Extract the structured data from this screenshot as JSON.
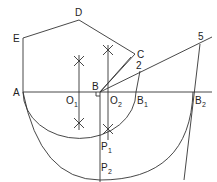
{
  "diagram": {
    "type": "geometric-construction",
    "labels": {
      "A": "A",
      "B": "B",
      "C": "C",
      "D": "D",
      "E": "E",
      "O1_main": "O",
      "O1_sub": "1",
      "O2_main": "O",
      "O2_sub": "2",
      "B1_main": "B",
      "B1_sub": "1",
      "B2_main": "B",
      "B2_sub": "2",
      "P1_main": "P",
      "P1_sub": "1",
      "P2_main": "P",
      "P2_sub": "2",
      "n2": "2",
      "n5": "5"
    },
    "points": {
      "A": [
        23,
        92
      ],
      "B": [
        100,
        92
      ],
      "C": [
        135,
        54
      ],
      "D": [
        79,
        20
      ],
      "E": [
        23,
        38
      ],
      "O1": [
        79,
        92
      ],
      "O2": [
        108,
        92
      ],
      "B1": [
        136,
        92
      ],
      "B2": [
        193,
        92
      ],
      "P1": [
        108,
        135
      ],
      "P2": [
        100,
        172
      ],
      "pt2": [
        140,
        70
      ],
      "pt5": [
        200,
        48
      ]
    },
    "colors": {
      "stroke": "#333333",
      "background": "#ffffff"
    }
  }
}
